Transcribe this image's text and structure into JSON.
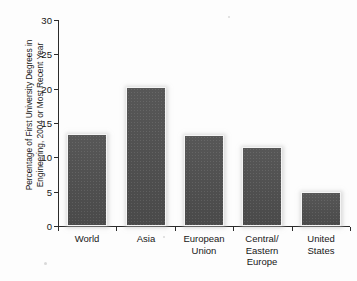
{
  "chart_data": {
    "type": "bar",
    "title": "",
    "xlabel": "",
    "ylabel": "Percentage of First University Degrees in Engineering, 2004 or Most Recent Year",
    "ylabel_lines": [
      "Percentage of First University Degrees in",
      "Engineering, 2004 or Most Recent Year"
    ],
    "categories": [
      "World",
      "Asia",
      "European Union",
      "Central/ Eastern Europe",
      "United States"
    ],
    "category_lines": [
      [
        "World"
      ],
      [
        "Asia"
      ],
      [
        "European",
        "Union"
      ],
      [
        "Central/",
        "Eastern",
        "Europe"
      ],
      [
        "United",
        "States"
      ]
    ],
    "values": [
      13.4,
      20.2,
      13.2,
      11.5,
      4.9
    ],
    "ylim": [
      0,
      30
    ],
    "yticks": [
      0,
      5,
      10,
      15,
      20,
      25,
      30
    ],
    "ytick_labels": [
      "0",
      "5",
      "10",
      "15",
      "20",
      "25",
      "30"
    ],
    "grid": false,
    "legend": null,
    "legend_position": "none",
    "bar_color": "#4e4e4e",
    "bar_edge_color": "#f4f4f4",
    "axis_color": "#2b2b2b",
    "background_color": "#fdfdfd"
  }
}
